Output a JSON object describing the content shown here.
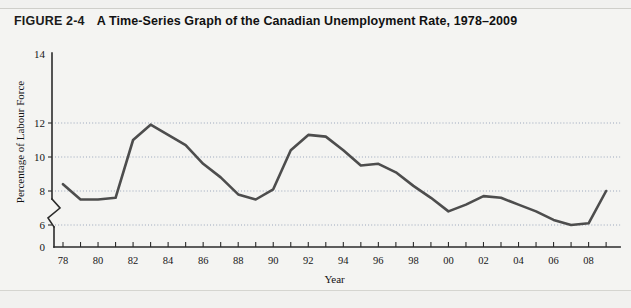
{
  "figure": {
    "number": "FIGURE 2-4",
    "caption": "A Time-Series Graph of the Canadian Unemployment Rate, 1978–2009"
  },
  "axis_titles": {
    "x": "Year",
    "y": "Percentage of Labour Force"
  },
  "colors": {
    "page_background": "#f1f1ef",
    "panel_background": "#f4f4f2",
    "line": "#4d4d4d",
    "grid": "#9aa6bb",
    "axis": "#2b2b2b",
    "text": "#161616"
  },
  "y_ticks": [
    "0",
    "6",
    "8",
    "10",
    "12",
    "14"
  ],
  "x_ticks": [
    "78",
    "80",
    "82",
    "84",
    "86",
    "88",
    "90",
    "92",
    "94",
    "96",
    "98",
    "00",
    "02",
    "04",
    "06",
    "08"
  ],
  "axis_break": "zigzag-break-between-0-and-6",
  "source_note": "",
  "chart_data": {
    "type": "line",
    "title": "A Time-Series Graph of the Canadian Unemployment Rate, 1978–2009",
    "xlabel": "Year",
    "ylabel": "Percentage of Labour Force",
    "xlim": [
      1978,
      2009
    ],
    "ylim": [
      5.0,
      14.0
    ],
    "ylim_display": [
      0,
      14
    ],
    "y_axis_broken": true,
    "grid": "horizontal-dotted-at-6-8-10-12",
    "legend": "none",
    "x": [
      1978,
      1979,
      1980,
      1981,
      1982,
      1983,
      1984,
      1985,
      1986,
      1987,
      1988,
      1989,
      1990,
      1991,
      1992,
      1993,
      1994,
      1995,
      1996,
      1997,
      1998,
      1999,
      2000,
      2001,
      2002,
      2003,
      2004,
      2005,
      2006,
      2007,
      2008,
      2009
    ],
    "values": [
      8.4,
      7.5,
      7.5,
      7.6,
      11.0,
      11.9,
      11.3,
      10.7,
      9.6,
      8.8,
      7.8,
      7.5,
      8.1,
      10.4,
      11.3,
      11.2,
      10.4,
      9.5,
      9.6,
      9.1,
      8.3,
      7.6,
      6.8,
      7.2,
      7.7,
      7.6,
      7.2,
      6.8,
      6.3,
      6.0,
      6.1,
      8.0
    ],
    "notable_points": [
      {
        "year": 1983,
        "value": 11.9,
        "note": "peak of early-1980s recession"
      },
      {
        "year": 1992,
        "value": 11.3,
        "note": "peak of early-1990s recession"
      },
      {
        "year": 2007,
        "value": 6.0,
        "note": "series low"
      },
      {
        "year": 2009,
        "value": 8.0,
        "note": "rise during 2008-09 recession"
      }
    ]
  }
}
